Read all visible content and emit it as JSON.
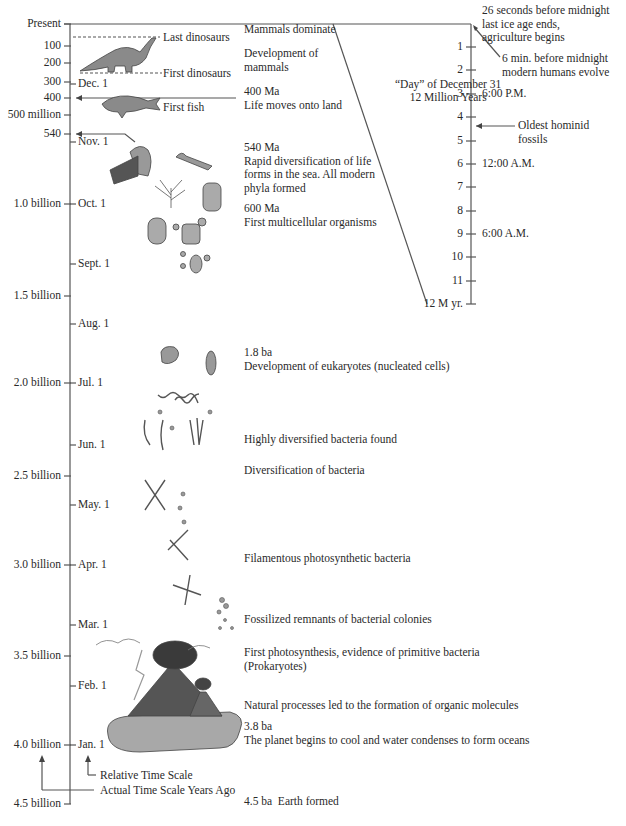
{
  "diagram": {
    "actual_scale": {
      "ticks": [
        {
          "label": "Present",
          "y": 24
        },
        {
          "label": "100",
          "y": 46
        },
        {
          "label": "200",
          "y": 63
        },
        {
          "label": "300",
          "y": 82
        },
        {
          "label": "400",
          "y": 98
        },
        {
          "label": "500 million",
          "y": 115
        },
        {
          "label": "540",
          "y": 134
        },
        {
          "label": "1.0 billion",
          "y": 204
        },
        {
          "label": "1.5 billion",
          "y": 296
        },
        {
          "label": "2.0 billion",
          "y": 383
        },
        {
          "label": "2.5 billion",
          "y": 476
        },
        {
          "label": "3.0 billion",
          "y": 565
        },
        {
          "label": "3.5 billion",
          "y": 656
        },
        {
          "label": "4.0 billion",
          "y": 745
        },
        {
          "label": "4.5 billion",
          "y": 804
        }
      ],
      "axis_label": "Actual Time Scale Years Ago"
    },
    "relative_scale": {
      "ticks": [
        {
          "label": "Dec. 1",
          "y": 84
        },
        {
          "label": "Nov. 1",
          "y": 142
        },
        {
          "label": "Oct. 1",
          "y": 204
        },
        {
          "label": "Sept. 1",
          "y": 264
        },
        {
          "label": "Aug. 1",
          "y": 324
        },
        {
          "label": "Jul. 1",
          "y": 383
        },
        {
          "label": "Jun. 1",
          "y": 445
        },
        {
          "label": "May. 1",
          "y": 505
        },
        {
          "label": "Apr. 1",
          "y": 565
        },
        {
          "label": "Mar. 1",
          "y": 625
        },
        {
          "label": "Feb. 1",
          "y": 686
        },
        {
          "label": "Jan. 1",
          "y": 745
        }
      ],
      "axis_label": "Relative Time Scale"
    },
    "day_scale": {
      "title_line1": "“Day” of December 31",
      "title_line2": "12 Million Years",
      "ticks": [
        {
          "label": "1",
          "y": 47,
          "time": ""
        },
        {
          "label": "2",
          "y": 70,
          "time": ""
        },
        {
          "label": "3",
          "y": 94,
          "time": "6:00 P.M."
        },
        {
          "label": "4",
          "y": 117,
          "time": ""
        },
        {
          "label": "5",
          "y": 141,
          "time": ""
        },
        {
          "label": "6",
          "y": 164,
          "time": "12:00 A.M."
        },
        {
          "label": "7",
          "y": 187,
          "time": ""
        },
        {
          "label": "8",
          "y": 211,
          "time": ""
        },
        {
          "label": "9",
          "y": 234,
          "time": "6:00 A.M."
        },
        {
          "label": "10",
          "y": 257,
          "time": ""
        },
        {
          "label": "11",
          "y": 281,
          "time": ""
        },
        {
          "label": "12 M yr.",
          "y": 304,
          "time": ""
        }
      ],
      "annotations": {
        "ice_age": "26 seconds before midnight\nlast ice age ends,\nagriculture begins",
        "humans": "6 min. before midnight\nmodern humans evolve",
        "hominid": "Oldest hominid\nfossils"
      }
    },
    "markers": {
      "last_dinosaurs": "Last dinosaurs",
      "first_dinosaurs": "First dinosaurs",
      "first_fish": "First fish"
    },
    "events": [
      {
        "y": 30,
        "text": "Mammals dominate"
      },
      {
        "y": 54,
        "text": "Development of\nmammals"
      },
      {
        "y": 92,
        "text": "400 Ma\nLife moves onto land"
      },
      {
        "y": 148,
        "text": "540 Ma\nRapid diversification of life\nforms in the sea. All modern\nphyla formed"
      },
      {
        "y": 209,
        "text": "600 Ma\nFirst multicellular organisms"
      },
      {
        "y": 353,
        "text": "1.8 ba\nDevelopment of eukaryotes (nucleated cells)"
      },
      {
        "y": 440,
        "text": "Highly diversified bacteria found"
      },
      {
        "y": 471,
        "text": "Diversification of bacteria"
      },
      {
        "y": 559,
        "text": "Filamentous photosynthetic bacteria"
      },
      {
        "y": 620,
        "text": "Fossilized remnants of bacterial colonies"
      },
      {
        "y": 653,
        "text": "First photosynthesis, evidence of primitive bacteria\n(Prokaryotes)"
      },
      {
        "y": 706,
        "text": "Natural processes led to the formation of organic molecules"
      },
      {
        "y": 727,
        "text": "3.8 ba\nThe planet begins to cool and water condenses to form oceans"
      },
      {
        "y": 802,
        "text": "4.5 ba  Earth formed"
      }
    ],
    "colors": {
      "line": "#555555",
      "fill": "#9a9a9a",
      "dark": "#4a4a4a",
      "text": "#2a2a2a"
    }
  }
}
